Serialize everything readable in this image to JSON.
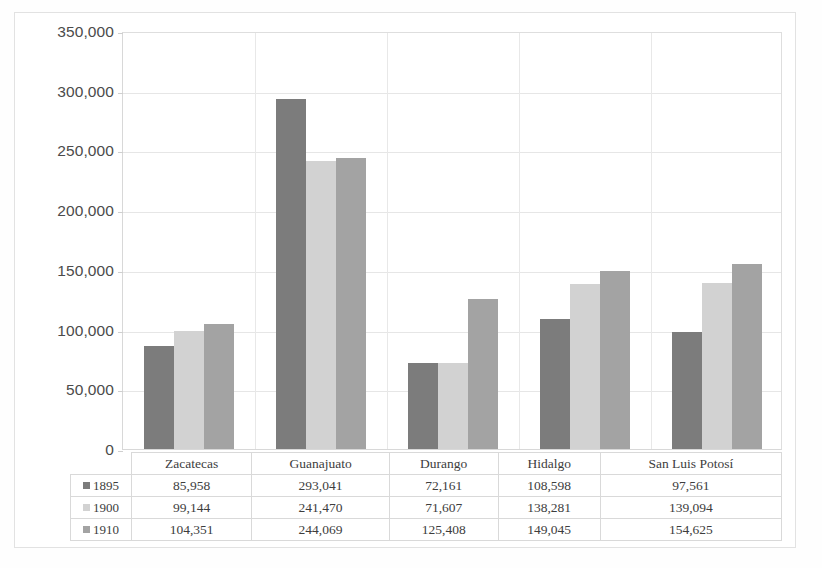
{
  "chart_data": {
    "type": "bar",
    "title": "",
    "xlabel": "",
    "ylabel": "",
    "ylim": [
      0,
      350000
    ],
    "ytick_labels": [
      "0",
      "50,000",
      "100,000",
      "150,000",
      "200,000",
      "250,000",
      "300,000",
      "350,000"
    ],
    "ytick_values": [
      0,
      50000,
      100000,
      150000,
      200000,
      250000,
      300000,
      350000
    ],
    "grid": true,
    "legend_position": "table-left",
    "categories": [
      "Zacatecas",
      "Guanajuato",
      "Durango",
      "Hidalgo",
      "San Luis Potosí"
    ],
    "series": [
      {
        "name": "1895",
        "color": "#7c7c7c",
        "values": [
          85958,
          293041,
          72161,
          108598,
          97561
        ]
      },
      {
        "name": "1900",
        "color": "#d2d2d2",
        "values": [
          99144,
          241470,
          71607,
          138281,
          139094
        ]
      },
      {
        "name": "1910",
        "color": "#a3a3a3",
        "values": [
          104351,
          244069,
          125408,
          149045,
          154625
        ]
      }
    ],
    "data_table": {
      "column_headers": [
        "Zacatecas",
        "Guanajuato",
        "Durango",
        "Hidalgo",
        "San Luis Potosí"
      ],
      "rows": [
        {
          "label": "1895",
          "color": "#7c7c7c",
          "cells": [
            "85,958",
            "293,041",
            "72,161",
            "108,598",
            "97,561"
          ]
        },
        {
          "label": "1900",
          "color": "#d2d2d2",
          "cells": [
            "99,144",
            "241,470",
            "71,607",
            "138,281",
            "139,094"
          ]
        },
        {
          "label": "1910",
          "color": "#a3a3a3",
          "cells": [
            "104,351",
            "244,069",
            "125,408",
            "149,045",
            "154,625"
          ]
        }
      ]
    }
  }
}
